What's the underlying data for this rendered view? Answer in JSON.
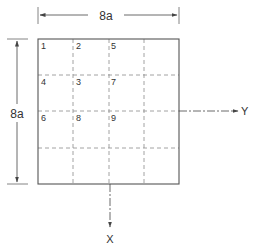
{
  "diagram": {
    "width_dimension": {
      "label": "8a"
    },
    "height_dimension": {
      "label": "8a"
    },
    "axes": {
      "x_label": "X",
      "y_label": "Y"
    },
    "grid": {
      "rows": 4,
      "cols": 4
    },
    "cell_labels": [
      {
        "text": "1",
        "row": 0,
        "col": 0
      },
      {
        "text": "2",
        "row": 0,
        "col": 1
      },
      {
        "text": "5",
        "row": 0,
        "col": 2
      },
      {
        "text": "4",
        "row": 1,
        "col": 0
      },
      {
        "text": "3",
        "row": 1,
        "col": 1
      },
      {
        "text": "7",
        "row": 1,
        "col": 2
      },
      {
        "text": "6",
        "row": 2,
        "col": 0
      },
      {
        "text": "8",
        "row": 2,
        "col": 1
      },
      {
        "text": "9",
        "row": 2,
        "col": 2
      }
    ],
    "colors": {
      "line": "#555555",
      "dashed": "#8a8a8a",
      "text": "#333333"
    }
  }
}
